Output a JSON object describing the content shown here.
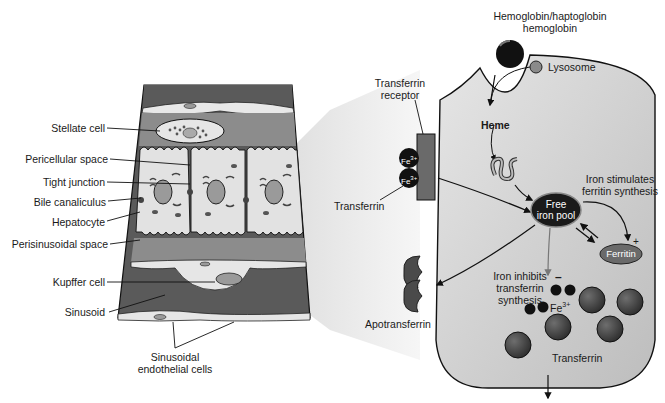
{
  "tissue_labels": {
    "stellate_cell": "Stellate cell",
    "pericellular_space": "Pericellular space",
    "tight_junction": "Tight junction",
    "bile_canaliculus": "Bile canaliculus",
    "hepatocyte": "Hepatocyte",
    "perisinusoidal_space": "Perisinusoidal space",
    "kupffer_cell": "Kupffer cell",
    "sinusoid": "Sinusoid",
    "sinusoidal_endothelial_line1": "Sinusoidal",
    "sinusoidal_endothelial_line2": "endothelial cells"
  },
  "cell_labels": {
    "hemoglobin_line1": "Hemoglobin/haptoglobin",
    "hemoglobin_line2": "hemoglobin",
    "lysosome": "Lysosome",
    "heme": "Heme",
    "transferrin_receptor_line1": "Transferrin",
    "transferrin_receptor_line2": "receptor",
    "fe3": "Fe",
    "fe3_sup": "3+",
    "transferrin_left": "Transferrin",
    "iron_stimulates_line1": "Iron stimulates",
    "iron_stimulates_line2": "ferritin synthesis",
    "free_iron_line1": "Free",
    "free_iron_line2": "iron pool",
    "plus": "+",
    "minus": "–",
    "ferritin": "Ferritin",
    "iron_inhibits_line1": "Iron inhibits",
    "iron_inhibits_line2": "transferrin",
    "iron_inhibits_line3": "synthesis",
    "fe3_inside": "Fe",
    "fe3_inside_sup": "3+",
    "apotransferrin": "Apotransferrin",
    "transferrin_bottom": "Transferrin"
  },
  "colors": {
    "sinusoid": "#5a5a5a",
    "space": "#8c8c8c",
    "hepatocyte": "#e2e2e2",
    "cell_body": "#cfcfcf",
    "dark": "#1a1a1a",
    "ferritin": "#6a6a6a",
    "transferrin_ball": "#4a4a4a"
  }
}
